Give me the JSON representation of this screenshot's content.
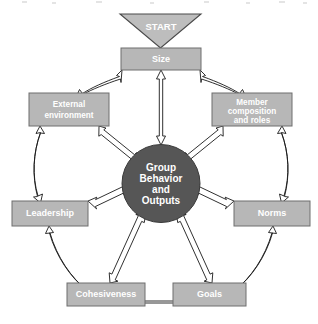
{
  "diagram": {
    "type": "hub-and-spoke cycle diagram",
    "colors": {
      "box_fill": "#b7b7b7",
      "box_stroke": "#6e6e6e",
      "center_fill": "#565656",
      "start_fill": "#bdbdbd",
      "label_text": "#ffffff",
      "arrow_fill": "#ffffff",
      "arrow_stroke": "#1a1a1a",
      "background": "#ffffff"
    },
    "start": {
      "label": "START",
      "shape": "down-triangle",
      "points_to": "Size"
    },
    "center": {
      "label_lines": [
        "Group",
        "Behavior",
        "and",
        "Outputs"
      ],
      "shape": "circle"
    },
    "nodes": [
      {
        "id": "size",
        "label_lines": [
          "Size"
        ],
        "position": "top"
      },
      {
        "id": "member-composition-and-roles",
        "label_lines": [
          "Member",
          "composition",
          "and roles"
        ],
        "position": "upper-right"
      },
      {
        "id": "norms",
        "label_lines": [
          "Norms"
        ],
        "position": "lower-right"
      },
      {
        "id": "goals",
        "label_lines": [
          "Goals"
        ],
        "position": "bottom-right"
      },
      {
        "id": "cohesiveness",
        "label_lines": [
          "Cohesiveness"
        ],
        "position": "bottom-left"
      },
      {
        "id": "leadership",
        "label_lines": [
          "Leadership"
        ],
        "position": "lower-left"
      },
      {
        "id": "external-environment",
        "label_lines": [
          "External",
          "environment"
        ],
        "position": "upper-left"
      }
    ],
    "spokes": [
      {
        "from": "size",
        "to": "center",
        "style": "double-headed"
      },
      {
        "from": "member-composition-and-roles",
        "to": "center",
        "style": "double-headed"
      },
      {
        "from": "norms",
        "to": "center",
        "style": "double-headed"
      },
      {
        "from": "goals",
        "to": "center",
        "style": "double-headed"
      },
      {
        "from": "cohesiveness",
        "to": "center",
        "style": "double-headed"
      },
      {
        "from": "leadership",
        "to": "center",
        "style": "double-headed"
      },
      {
        "from": "external-environment",
        "to": "center",
        "style": "double-headed"
      }
    ],
    "ring_links": [
      {
        "from": "size",
        "to": "member-composition-and-roles",
        "style": "double-headed curved"
      },
      {
        "from": "member-composition-and-roles",
        "to": "norms",
        "style": "double-headed curved"
      },
      {
        "from": "norms",
        "to": "goals",
        "style": "double-headed curved"
      },
      {
        "from": "goals",
        "to": "cohesiveness",
        "style": "double-headed straight"
      },
      {
        "from": "cohesiveness",
        "to": "leadership",
        "style": "double-headed curved"
      },
      {
        "from": "leadership",
        "to": "external-environment",
        "style": "double-headed curved"
      },
      {
        "from": "external-environment",
        "to": "size",
        "style": "double-headed curved"
      }
    ]
  }
}
